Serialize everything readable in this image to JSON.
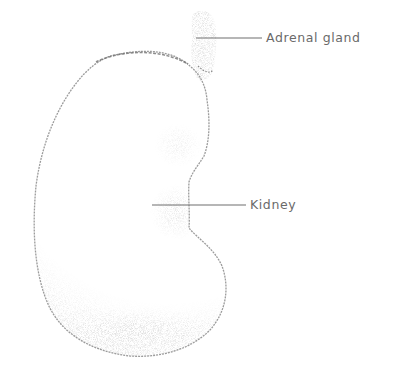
{
  "diagram": {
    "labels": [
      {
        "id": "adrenal",
        "text": "Adrenal gland"
      },
      {
        "id": "kidney",
        "text": "Kidney"
      }
    ]
  },
  "colors": {
    "outline": "#8a8a8a",
    "stipple": "#9a9a9a",
    "leader_line": "#6e6e6e",
    "label_text": "#6a6a6a",
    "background": "#ffffff"
  }
}
